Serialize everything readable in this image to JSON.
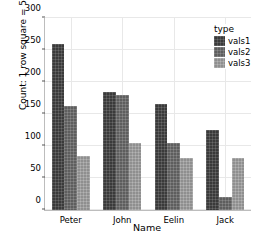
{
  "chart_data": {
    "type": "bar",
    "title": "",
    "xlabel": "Name",
    "ylabel": "Count: 1 row square = 5",
    "categories": [
      "Peter",
      "John",
      "Eelin",
      "Jack"
    ],
    "series": [
      {
        "name": "vals1",
        "color": "#3a3a3a",
        "values": [
          260,
          185,
          165,
          125
        ]
      },
      {
        "name": "vals2",
        "color": "#5e5e5e",
        "values": [
          163,
          180,
          105,
          20
        ]
      },
      {
        "name": "vals3",
        "color": "#8f8f8f",
        "values": [
          85,
          105,
          82,
          82
        ]
      }
    ],
    "ylim": [
      0,
      300
    ],
    "yticks": [
      0,
      50,
      100,
      150,
      200,
      250,
      300
    ],
    "ytick_labels": [
      "0",
      "50",
      "100",
      "150",
      "200",
      "250",
      "300"
    ],
    "grid": true,
    "legend": {
      "title": "type",
      "position": "top-right",
      "entries": [
        "vals1",
        "vals2",
        "vals3"
      ]
    }
  }
}
